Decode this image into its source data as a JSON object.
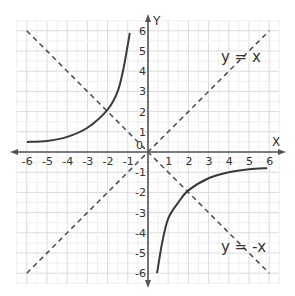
{
  "chart_data": {
    "type": "line",
    "title": "",
    "xlabel": "X",
    "ylabel": "Y",
    "xlim": [
      -6,
      6
    ],
    "ylim": [
      -6,
      6
    ],
    "grid": true,
    "x_ticks": [
      "-6",
      "-5",
      "-4",
      "-3",
      "-2",
      "-1",
      "0",
      "1",
      "2",
      "3",
      "4",
      "5",
      "6"
    ],
    "y_ticks": [
      "-6",
      "-5",
      "-4",
      "-3",
      "-2",
      "-1",
      "1",
      "2",
      "3",
      "4",
      "5",
      "6"
    ],
    "origin_label": "0",
    "annotations": [
      {
        "text": "y = x",
        "x": 4.6,
        "y": 4.7
      },
      {
        "text": "y = -x",
        "x": 4.6,
        "y": -4.7
      }
    ],
    "series": [
      {
        "name": "y = x",
        "style": "dashed",
        "points": [
          [
            -6,
            -6
          ],
          [
            6,
            6
          ]
        ]
      },
      {
        "name": "y = -x",
        "style": "dashed",
        "points": [
          [
            -6,
            6
          ],
          [
            6,
            -6
          ]
        ]
      },
      {
        "name": "curve branch (x<0)",
        "style": "solid",
        "points": [
          [
            -6,
            0.5
          ],
          [
            -5,
            0.55
          ],
          [
            -4,
            0.75
          ],
          [
            -3,
            1.2
          ],
          [
            -2,
            2.1
          ],
          [
            -1.5,
            3.0
          ],
          [
            -1.2,
            4.2
          ],
          [
            -0.9,
            5.9
          ]
        ]
      },
      {
        "name": "curve branch (x>0)",
        "style": "solid",
        "points": [
          [
            0.45,
            -6
          ],
          [
            0.7,
            -4.5
          ],
          [
            1,
            -3.3
          ],
          [
            1.5,
            -2.5
          ],
          [
            2,
            -1.9
          ],
          [
            3,
            -1.3
          ],
          [
            4,
            -1.0
          ],
          [
            5,
            -0.85
          ],
          [
            5.9,
            -0.8
          ]
        ]
      }
    ],
    "colors": {
      "axis": "#555555",
      "grid": "#e3e3e3",
      "curve": "#3a3a3a",
      "dashed": "#555555"
    }
  }
}
